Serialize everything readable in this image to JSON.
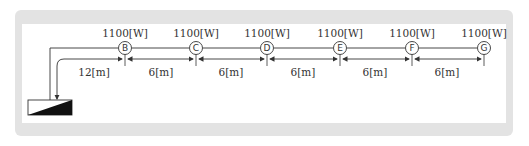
{
  "diagram": {
    "type": "electrical single-line load distribution",
    "source": {
      "name": "distribution-panel"
    },
    "feeder_length_label": "12[m]",
    "nodes": [
      {
        "id": "B",
        "load": "1100[W]"
      },
      {
        "id": "C",
        "load": "1100[W]"
      },
      {
        "id": "D",
        "load": "1100[W]"
      },
      {
        "id": "E",
        "load": "1100[W]"
      },
      {
        "id": "F",
        "load": "1100[W]"
      },
      {
        "id": "G",
        "load": "1100[W]"
      }
    ],
    "spans": [
      {
        "from": "panel",
        "to": "B",
        "length": "12[m]"
      },
      {
        "from": "B",
        "to": "C",
        "length": "6[m]"
      },
      {
        "from": "C",
        "to": "D",
        "length": "6[m]"
      },
      {
        "from": "D",
        "to": "E",
        "length": "6[m]"
      },
      {
        "from": "E",
        "to": "F",
        "length": "6[m]"
      },
      {
        "from": "F",
        "to": "G",
        "length": "6[m]"
      }
    ],
    "colors": {
      "frame": "#e3e3e3",
      "line": "#333333",
      "panel": "#ffffff"
    }
  }
}
